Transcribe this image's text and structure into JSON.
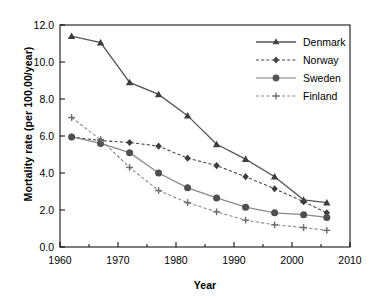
{
  "chart_data": {
    "type": "line",
    "title": "",
    "xlabel": "Year",
    "ylabel": "Mortality rate (per 100,00/year)",
    "xlim": [
      1960,
      2010
    ],
    "ylim": [
      0.0,
      12.0
    ],
    "xticks": [
      1960,
      1970,
      1980,
      1990,
      2000,
      2010
    ],
    "yticks": [
      "0.0",
      "2.0",
      "4.0",
      "6.0",
      "8.0",
      "10.0",
      "12.0"
    ],
    "xtick_interval": 10,
    "xminor_interval": 5,
    "ytick_interval": 2.0,
    "grid": false,
    "legend_position": "upper right",
    "x": [
      1962,
      1967,
      1972,
      1977,
      1982,
      1987,
      1992,
      1997,
      2002,
      2006
    ],
    "series": [
      {
        "name": "Denmark",
        "marker": "triangle",
        "linestyle": "solid",
        "color": "#555555",
        "values": [
          11.4,
          11.05,
          8.9,
          8.25,
          7.1,
          5.55,
          4.75,
          3.8,
          2.55,
          2.4
        ]
      },
      {
        "name": "Norway",
        "marker": "diamond",
        "linestyle": "dashed",
        "color": "#444444",
        "values": [
          5.95,
          5.75,
          5.65,
          5.45,
          4.8,
          4.4,
          3.8,
          3.15,
          2.45,
          1.85
        ]
      },
      {
        "name": "Sweden",
        "marker": "circle",
        "linestyle": "solid",
        "color": "#555555",
        "values": [
          5.95,
          5.6,
          5.1,
          4.0,
          3.2,
          2.65,
          2.15,
          1.85,
          1.75,
          1.6
        ]
      },
      {
        "name": "Finland",
        "marker": "cross",
        "linestyle": "dashed",
        "color": "#888888",
        "values": [
          7.0,
          5.8,
          4.3,
          3.05,
          2.4,
          1.9,
          1.45,
          1.2,
          1.05,
          0.9
        ]
      }
    ]
  }
}
